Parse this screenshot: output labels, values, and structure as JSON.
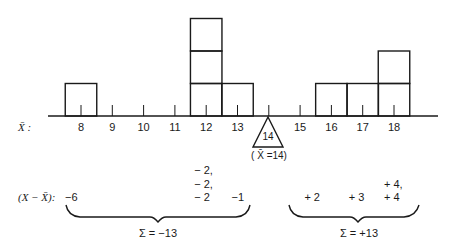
{
  "figure": {
    "axis_label": "X̄ :",
    "deviation_label": "(X − X̄):",
    "mean_value_label": "14",
    "mean_caption": "( X̄ =14)",
    "colors": {
      "ink": "#1a1a1a",
      "background": "#ffffff"
    }
  },
  "axis": {
    "ticks": [
      "8",
      "9",
      "10",
      "11",
      "12",
      "13",
      "14",
      "15",
      "16",
      "17",
      "18"
    ]
  },
  "boxes": [
    {
      "value": 8,
      "count": 1
    },
    {
      "value": 12,
      "count": 3
    },
    {
      "value": 13,
      "count": 1
    },
    {
      "value": 16,
      "count": 1
    },
    {
      "value": 17,
      "count": 1
    },
    {
      "value": 18,
      "count": 2
    }
  ],
  "deviations": {
    "left": [
      {
        "value": 8,
        "lines": [
          "−6"
        ]
      },
      {
        "value": 12,
        "lines": [
          "− 2,",
          "− 2,",
          "− 2"
        ]
      },
      {
        "value": 13,
        "lines": [
          "−1"
        ]
      }
    ],
    "right": [
      {
        "value": 16,
        "lines": [
          "+ 2"
        ]
      },
      {
        "value": 17,
        "lines": [
          "+ 3"
        ]
      },
      {
        "value": 18,
        "lines": [
          "+ 4,",
          "+ 4"
        ]
      }
    ]
  },
  "sums": {
    "left": "Σ = −13",
    "right": "Σ = +13"
  },
  "chart_data": {
    "type": "dot-box histogram (balance diagram)",
    "title": "",
    "xlabel": "X̄",
    "categories": [
      8,
      9,
      10,
      11,
      12,
      13,
      14,
      15,
      16,
      17,
      18
    ],
    "values": [
      1,
      0,
      0,
      0,
      3,
      1,
      0,
      0,
      1,
      1,
      2
    ],
    "mean": 14,
    "deviations_below_mean": [
      -6,
      -2,
      -2,
      -2,
      -1
    ],
    "deviations_above_mean": [
      2,
      3,
      4,
      4
    ],
    "sum_below": -13,
    "sum_above": 13,
    "grid": false
  }
}
